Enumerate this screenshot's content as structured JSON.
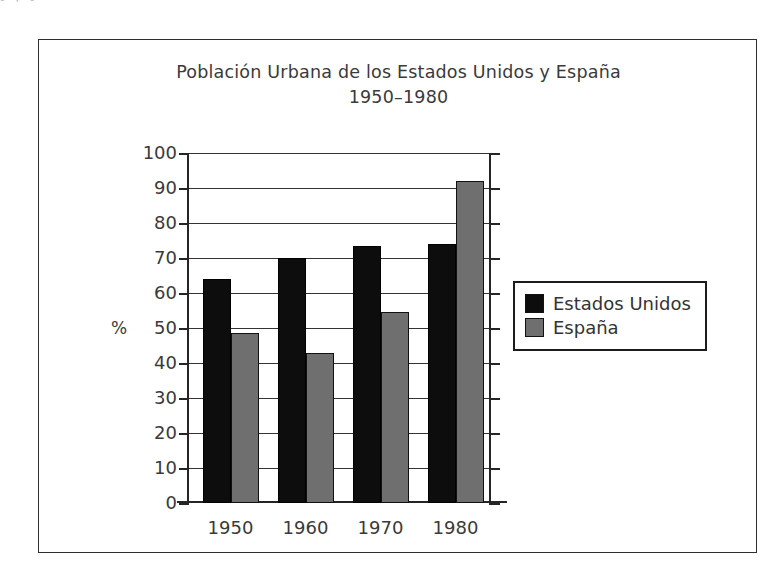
{
  "figure": {
    "page_text_fragment": "l y                    l",
    "title_line1": "Población Urbana de los Estados Unidos y España",
    "title_line2": "1950–1980"
  },
  "axes": {
    "y_axis_title": "%",
    "y_ticks": [
      "100",
      "90",
      "80",
      "70",
      "60",
      "50",
      "40",
      "30",
      "20",
      "10",
      "0"
    ],
    "x_ticks": [
      "1950",
      "1960",
      "1970",
      "1980"
    ]
  },
  "legend": {
    "items": [
      {
        "label": "Estados Unidos",
        "color": "#0d0d0d"
      },
      {
        "label": "España",
        "color": "#6f6f6f"
      }
    ]
  },
  "chart_data": {
    "type": "bar",
    "title": "Población Urbana de los Estados Unidos y España 1950–1980",
    "xlabel": "",
    "ylabel": "%",
    "ylim": [
      0,
      100
    ],
    "ytick_step": 10,
    "grid": true,
    "legend_position": "right",
    "categories": [
      "1950",
      "1960",
      "1970",
      "1980"
    ],
    "series": [
      {
        "name": "Estados Unidos",
        "color": "#0d0d0d",
        "values": [
          64,
          70,
          73.5,
          74
        ]
      },
      {
        "name": "España",
        "color": "#6f6f6f",
        "values": [
          48.5,
          43,
          54.7,
          92
        ]
      }
    ]
  }
}
